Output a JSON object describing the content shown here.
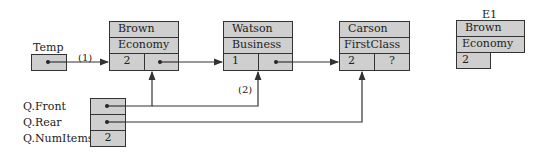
{
  "nodes": [
    {
      "name": "Brown",
      "class": "Economy",
      "value": "2",
      "next": "pointer"
    },
    {
      "name": "Watson",
      "class": "Business",
      "value": "1",
      "next": "pointer"
    },
    {
      "name": "Carson",
      "class": "FirstClass",
      "value": "2",
      "next": "?"
    }
  ],
  "temp": {
    "label": "Temp",
    "value": "pointer"
  },
  "e1": {
    "label": "E1",
    "name": "Brown",
    "class": "Economy",
    "value": "2"
  },
  "queue": {
    "front_label": "Q.Front",
    "rear_label": "Q.Rear",
    "numitems_label": "Q.NumItems",
    "numitems_value": "2"
  },
  "annotations": {
    "step1": "(1)",
    "step2": "(2)"
  },
  "colors": {
    "cell_fill": "#cfcfcf",
    "border": "#333333",
    "line": "#333333"
  }
}
